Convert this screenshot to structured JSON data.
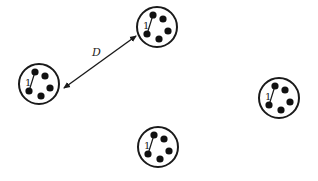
{
  "diagram": {
    "distance_label": "D",
    "colors": {
      "stroke": "#1a1a1a",
      "dot": "#111111",
      "background": "#ffffff"
    },
    "arrow": {
      "x1": 64,
      "y1": 88,
      "x2": 136,
      "y2": 36,
      "label_x": 92,
      "label_y": 56
    },
    "clusters": [
      {
        "id": "top",
        "cx": 157,
        "cy": 27,
        "r": 20,
        "link_label": "1"
      },
      {
        "id": "left",
        "cx": 39,
        "cy": 84,
        "r": 20,
        "link_label": "1"
      },
      {
        "id": "right",
        "cx": 279,
        "cy": 98,
        "r": 20,
        "link_label": "1"
      },
      {
        "id": "bottom",
        "cx": 158,
        "cy": 147,
        "r": 20,
        "link_label": "1"
      }
    ],
    "dot_offsets": [
      {
        "dx": -4,
        "dy": -12
      },
      {
        "dx": 6,
        "dy": -8
      },
      {
        "dx": 11,
        "dy": 4
      },
      {
        "dx": 2,
        "dy": 12
      },
      {
        "dx": -10,
        "dy": 7
      }
    ],
    "link": {
      "from_dot": 0,
      "to_dot": 4
    }
  }
}
